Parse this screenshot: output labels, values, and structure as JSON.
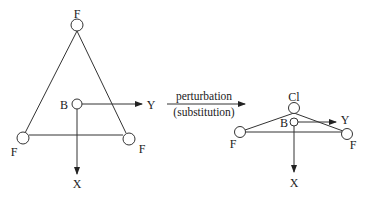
{
  "reactant": {
    "atoms": {
      "top": "F",
      "left": "F",
      "right": "F",
      "center": "B"
    },
    "axes": {
      "horizontal": "Y",
      "vertical": "X"
    }
  },
  "arrow": {
    "above": "perturbation",
    "below": "(substitution)"
  },
  "product": {
    "atoms": {
      "top": "Cl",
      "left": "F",
      "right": "F",
      "center": "B"
    },
    "axes": {
      "horizontal": "Y",
      "vertical": "X"
    }
  },
  "colors": {
    "line": "#333333",
    "text": "#222222",
    "background": "#ffffff"
  }
}
